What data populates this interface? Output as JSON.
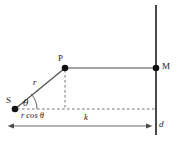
{
  "figure": {
    "type": "geometry-diagram",
    "background_color": "#ffffff",
    "line_color": "#3a3a3a",
    "dash_color": "#6e6e6e",
    "text_color": "#1a1a1a",
    "points": [
      {
        "id": "S",
        "label": "S",
        "x": 15,
        "y": 109,
        "label_x": 7,
        "label_y": 98,
        "dot_r": 3.2
      },
      {
        "id": "P",
        "label": "P",
        "x": 65,
        "y": 68,
        "label_x": 59,
        "label_y": 55,
        "dot_r": 3.2
      },
      {
        "id": "M",
        "label": "M",
        "x": 156,
        "y": 68,
        "label_x": 162,
        "label_y": 62,
        "dot_r": 3.2
      }
    ],
    "labels": {
      "r": "r",
      "theta": "θ",
      "r_cos_theta": "r cos θ",
      "k": "k",
      "d": "d",
      "S": "S",
      "P": "P",
      "M": "M"
    },
    "segments": {
      "wall_x": 156,
      "wall_top_y": 5,
      "wall_bottom_y": 135,
      "ray_y": 68,
      "baseline_y": 109,
      "dim_line_y": 126,
      "dim_left_x": 8,
      "dim_right_x": 152
    },
    "label_positions": {
      "r": {
        "x": 33,
        "y": 79
      },
      "theta": {
        "x": 23,
        "y": 100
      },
      "r_cos_theta": {
        "x": 22,
        "y": 112
      },
      "k": {
        "x": 84,
        "y": 114
      },
      "d": {
        "x": 159,
        "y": 121
      }
    }
  }
}
